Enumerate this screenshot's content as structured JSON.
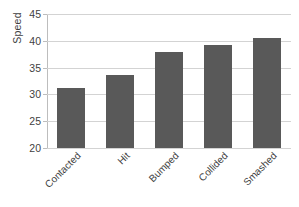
{
  "chart_data": {
    "type": "bar",
    "title": "",
    "xlabel": "",
    "ylabel": "Speed",
    "categories": [
      "Contacted",
      "Hit",
      "Bumped",
      "Collided",
      "Smashed"
    ],
    "values": [
      31.2,
      33.7,
      38.0,
      39.3,
      40.6
    ],
    "ylim": [
      20,
      45
    ],
    "yticks": [
      20,
      25,
      30,
      35,
      40,
      45
    ],
    "ytick_labels": [
      "20",
      "25",
      "30",
      "35",
      "40",
      "45"
    ],
    "grid": true,
    "legend": false,
    "bar_color": "#595959",
    "gridline_color": "#d3d3d3",
    "axis_color": "#bdbdbd",
    "series": [
      {
        "name": "Speed",
        "values": [
          31.2,
          33.7,
          38.0,
          39.3,
          40.6
        ]
      }
    ]
  },
  "axis": {
    "y_title": "Speed"
  }
}
